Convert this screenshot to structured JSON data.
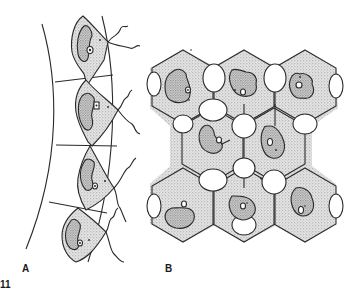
{
  "figure": {
    "number": "11",
    "panels": [
      {
        "label": "A",
        "description": "Curved epithelial strip divided into four compartments, each containing a stippled cell with lobed cytoplasm, nucleus and wavy processes extending to the right"
      },
      {
        "label": "B",
        "description": "Honeycomb arrangement of hexagonal units with stippled fill and rounded cell bodies containing nuclei"
      }
    ]
  },
  "colors": {
    "line": "#2a2a2a",
    "stipple": "#c8c8c8",
    "background": "#ffffff"
  }
}
